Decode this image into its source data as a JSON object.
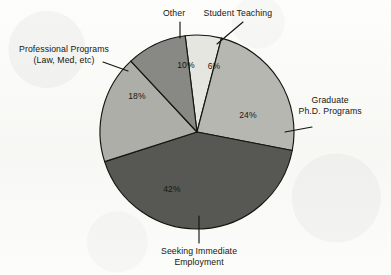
{
  "figure": {
    "background_color": "#fbfbf9",
    "outline_color": "#15150f"
  },
  "chart_data": {
    "type": "pie",
    "title": "",
    "subtitle": "",
    "xlabel": "",
    "ylabel": "",
    "legend_position": "callouts-around-pie",
    "grid": false,
    "units": "percent",
    "total": 100,
    "categories": [
      "Student Teaching",
      "Graduate Ph.D. Programs",
      "Seeking Immediate Employment",
      "Professional Programs (Law, Med, etc)",
      "Other"
    ],
    "values": [
      6,
      24,
      42,
      18,
      10
    ],
    "slices": [
      {
        "id": "student-teaching",
        "label": "Student Teaching",
        "label_line1": "Student Teaching",
        "label_line2": "",
        "value": 6,
        "value_label": "6%",
        "color": "#e6e6e1",
        "start_deg": -7,
        "end_deg": 14.6,
        "pct_label_x": 214,
        "pct_label_y": 67,
        "callout_left": 238,
        "callout_top": 8,
        "callout_align": "center",
        "leader": {
          "x1": 217,
          "y1": 44,
          "x2": 243,
          "y2": 22
        }
      },
      {
        "id": "graduate-phd",
        "label": "Graduate Ph.D. Programs",
        "label_line1": "Graduate",
        "label_line2": "Ph.D. Programs",
        "value": 24,
        "value_label": "24%",
        "color": "#b7b7b2",
        "start_deg": 14.6,
        "end_deg": 101,
        "pct_label_x": 248,
        "pct_label_y": 116,
        "callout_left": 330,
        "callout_top": 95,
        "callout_align": "center",
        "leader": {
          "x1": 285,
          "y1": 132,
          "x2": 312,
          "y2": 127
        }
      },
      {
        "id": "seeking-employment",
        "label": "Seeking Immediate Employment",
        "label_line1": "Seeking Immediate",
        "label_line2": "Employment",
        "value": 42,
        "value_label": "42%",
        "color": "#575753",
        "start_deg": 101,
        "end_deg": 252.2,
        "pct_label_x": 172,
        "pct_label_y": 190,
        "callout_left": 199,
        "callout_top": 246,
        "callout_align": "center",
        "leader": {
          "x1": 199,
          "y1": 216,
          "x2": 199,
          "y2": 243
        }
      },
      {
        "id": "professional-programs",
        "label": "Professional Programs (Law, Med, etc)",
        "label_line1": "Professional Programs",
        "label_line2": "(Law, Med, etc)",
        "value": 18,
        "value_label": "18%",
        "color": "#aeaea9",
        "start_deg": 252.2,
        "end_deg": 317,
        "pct_label_x": 137,
        "pct_label_y": 97,
        "callout_left": 64,
        "callout_top": 44,
        "callout_align": "center",
        "leader": {
          "x1": 128,
          "y1": 71,
          "x2": 103,
          "y2": 62
        }
      },
      {
        "id": "other",
        "label": "Other",
        "label_line1": "Other",
        "label_line2": "",
        "value": 10,
        "value_label": "10%",
        "color": "#888884",
        "start_deg": 317,
        "end_deg": 353,
        "pct_label_x": 186,
        "pct_label_y": 66,
        "callout_left": 174,
        "callout_top": 8,
        "callout_align": "center",
        "leader": {
          "x1": 180,
          "y1": 38,
          "x2": 180,
          "y2": 22
        }
      }
    ],
    "geometry": {
      "center_x": 197,
      "center_y": 132,
      "radius": 97
    }
  }
}
